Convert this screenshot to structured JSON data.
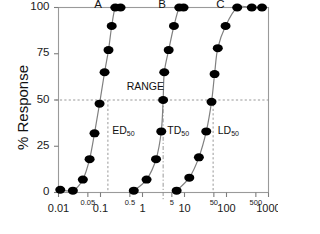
{
  "chart_data": {
    "type": "line",
    "title": "",
    "xlabel": "",
    "ylabel": "% Response",
    "xscale": "log",
    "xlim": [
      0.01,
      1000
    ],
    "ylim": [
      0,
      100
    ],
    "grid": false,
    "legend_position": "inline-curve-labels",
    "y_ticks": [
      0,
      25,
      50,
      75,
      100
    ],
    "y_tick_labels": [
      "0",
      "25",
      "50",
      "75",
      "100"
    ],
    "x_ticks": [
      0.01,
      0.05,
      0.1,
      0.5,
      1,
      5,
      10,
      50,
      100,
      500,
      1000
    ],
    "x_tick_labels": [
      "0.01",
      "0.05",
      "0.1",
      "0.5",
      "1",
      "5",
      "10",
      "50",
      "100",
      "500",
      "1000"
    ],
    "x_tick_minor_flags": [
      false,
      true,
      false,
      true,
      false,
      true,
      false,
      true,
      false,
      true,
      false
    ],
    "series": [
      {
        "name": "A",
        "label": "A",
        "marker": "filled-circle",
        "color": "#000000",
        "line_color": "#808080",
        "x": [
          0.011,
          0.022,
          0.038,
          0.055,
          0.072,
          0.095,
          0.125,
          0.155,
          0.185,
          0.225,
          0.3
        ],
        "y": [
          1.5,
          1.0,
          7,
          18,
          32,
          48,
          65,
          77,
          90,
          100,
          100
        ]
      },
      {
        "name": "B",
        "label": "B",
        "marker": "filled-circle",
        "color": "#000000",
        "line_color": "#808080",
        "x": [
          0.62,
          1.25,
          2.1,
          2.8,
          3.1,
          3.3,
          4.2,
          5.6,
          7.5,
          9.5
        ],
        "y": [
          1.0,
          7,
          18,
          33,
          50,
          65,
          77,
          90,
          100,
          100
        ]
      },
      {
        "name": "C",
        "label": "C",
        "marker": "filled-circle",
        "color": "#000000",
        "line_color": "#808080",
        "x": [
          6.5,
          13,
          22,
          33,
          44,
          52,
          62,
          95,
          180,
          400,
          700
        ],
        "y": [
          1.0,
          8,
          19,
          33,
          49,
          64,
          78,
          90,
          100,
          100,
          100
        ]
      }
    ],
    "reference_lines": [
      {
        "name": "response-50-line",
        "orientation": "horizontal",
        "value": 50,
        "style": "dashed"
      },
      {
        "name": "ed50-line",
        "orientation": "vertical",
        "value": 0.15,
        "style": "dashed"
      },
      {
        "name": "td50-line",
        "orientation": "vertical",
        "value": 3.1,
        "style": "dash-dot"
      },
      {
        "name": "ld50-line",
        "orientation": "vertical",
        "value": 48,
        "style": "dashed"
      }
    ],
    "annotations": [
      {
        "name": "range-annotation",
        "text": "RANGE",
        "x": 0.42,
        "y": 57
      },
      {
        "name": "ed50-annotation",
        "text": "ED",
        "sub": "50",
        "x": 0.19,
        "y": 33
      },
      {
        "name": "td50-annotation",
        "text": "TD",
        "sub": "50",
        "x": 3.9,
        "y": 33
      },
      {
        "name": "ld50-annotation",
        "text": "LD",
        "sub": "50",
        "x": 62,
        "y": 33
      }
    ]
  }
}
